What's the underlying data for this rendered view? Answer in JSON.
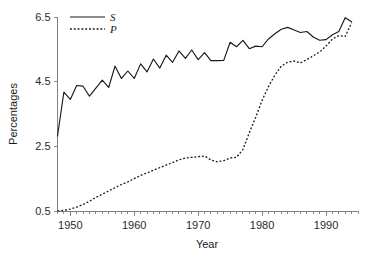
{
  "chart_data": {
    "type": "line",
    "title": "",
    "xlabel": "Year",
    "ylabel": "Percentages",
    "xlim": [
      1948,
      1995
    ],
    "ylim": [
      0.5,
      6.5
    ],
    "xticks": [
      1950,
      1960,
      1970,
      1980,
      1990
    ],
    "xtick_labels": [
      "1950",
      "1960",
      "1970",
      "1980",
      "1990"
    ],
    "yticks": [
      0.5,
      2.5,
      4.5,
      6.5
    ],
    "ytick_labels": [
      "0.5",
      "2.5",
      "4.5",
      "6.5"
    ],
    "minor_xtick_interval": 1,
    "grid": false,
    "legend_position": "top-left",
    "x": [
      1948,
      1949,
      1950,
      1951,
      1952,
      1953,
      1954,
      1955,
      1956,
      1957,
      1958,
      1959,
      1960,
      1961,
      1962,
      1963,
      1964,
      1965,
      1966,
      1967,
      1968,
      1969,
      1970,
      1971,
      1972,
      1973,
      1974,
      1975,
      1976,
      1977,
      1978,
      1979,
      1980,
      1981,
      1982,
      1983,
      1984,
      1985,
      1986,
      1987,
      1988,
      1989,
      1990,
      1991,
      1992,
      1993,
      1994
    ],
    "series": [
      {
        "name": "S",
        "style": "solid",
        "values": [
          2.82,
          4.18,
          3.95,
          4.38,
          4.36,
          4.05,
          4.3,
          4.55,
          4.32,
          4.98,
          4.6,
          4.83,
          4.6,
          5.05,
          4.8,
          5.2,
          4.92,
          5.32,
          5.1,
          5.45,
          5.22,
          5.48,
          5.18,
          5.4,
          5.15,
          5.15,
          5.16,
          5.72,
          5.58,
          5.78,
          5.52,
          5.6,
          5.58,
          5.82,
          5.98,
          6.12,
          6.18,
          6.1,
          6.02,
          6.05,
          5.88,
          5.78,
          5.8,
          5.95,
          6.05,
          6.48,
          6.35
        ]
      },
      {
        "name": "P",
        "style": "dotted",
        "values": [
          0.5,
          0.52,
          0.56,
          0.62,
          0.7,
          0.8,
          0.92,
          1.02,
          1.12,
          1.22,
          1.32,
          1.4,
          1.5,
          1.6,
          1.68,
          1.76,
          1.84,
          1.92,
          2.0,
          2.08,
          2.14,
          2.16,
          2.18,
          2.2,
          2.08,
          2.02,
          2.06,
          2.14,
          2.16,
          2.4,
          2.92,
          3.4,
          3.92,
          4.35,
          4.7,
          4.98,
          5.1,
          5.14,
          5.08,
          5.18,
          5.3,
          5.42,
          5.6,
          5.82,
          5.92,
          5.9,
          6.32
        ]
      }
    ],
    "legend": [
      {
        "label": "S",
        "style": "solid"
      },
      {
        "label": "P",
        "style": "dotted"
      }
    ],
    "colors": {
      "series": "#1a1a1a",
      "axis": "#808080",
      "text": "#1a1a1a",
      "background": "#ffffff"
    }
  }
}
